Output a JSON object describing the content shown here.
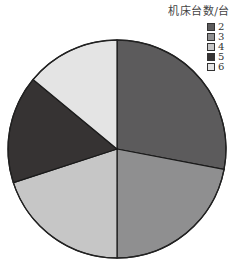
{
  "chart_data": {
    "type": "pie",
    "title": "机床台数/台",
    "categories": [
      "2",
      "3",
      "4",
      "5",
      "6"
    ],
    "values": [
      28,
      22,
      20,
      16,
      14
    ],
    "unit": "percent (estimated from slice angles)",
    "colors": [
      "#5c5b5c",
      "#8f8f90",
      "#c6c6c6",
      "#363333",
      "#e4e4e4"
    ],
    "start_angle_deg": 0,
    "direction": "clockwise",
    "legend_position": "top-right"
  },
  "legend": {
    "title": "机床台数/台",
    "items": [
      {
        "label": "2",
        "color": "#5c5b5c"
      },
      {
        "label": "3",
        "color": "#8f8f90"
      },
      {
        "label": "4",
        "color": "#c6c6c6"
      },
      {
        "label": "5",
        "color": "#363333"
      },
      {
        "label": "6",
        "color": "#e4e4e4"
      }
    ]
  }
}
